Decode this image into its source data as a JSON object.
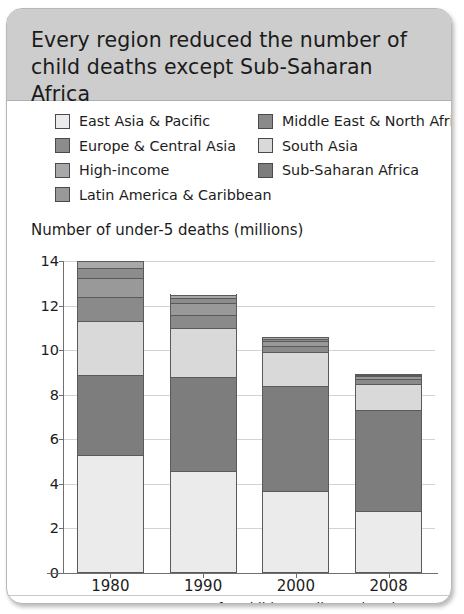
{
  "card": {
    "title": "Every region reduced the number of child deaths except Sub-Saharan Africa",
    "source": "Source: Inter-agency Group for Child Mortality estimation",
    "header_bg": "#cdcdcd"
  },
  "legend": {
    "left": [
      {
        "label": "East Asia & Pacific",
        "color": "#ebebeb"
      },
      {
        "label": "Europe & Central Asia",
        "color": "#8c8c8c"
      },
      {
        "label": "High-income",
        "color": "#a8a8a8"
      },
      {
        "label": "Latin America & Caribbean",
        "color": "#999999"
      }
    ],
    "right": [
      {
        "label": "Middle East & North Africa",
        "color": "#8a8a8a"
      },
      {
        "label": "South Asia",
        "color": "#d9d9d9"
      },
      {
        "label": "Sub-Saharan Africa",
        "color": "#7d7d7d"
      }
    ]
  },
  "chart_data": {
    "type": "bar",
    "subtype": "stacked",
    "title": "Every region reduced the number of child deaths except Sub-Saharan Africa",
    "xlabel": "",
    "ylabel": "Number of under-5 deaths (millions)",
    "ylim": [
      0,
      14
    ],
    "yticks": [
      0,
      2,
      4,
      6,
      8,
      10,
      12,
      14
    ],
    "grid": true,
    "legend_position": "top",
    "categories": [
      "1980",
      "1990",
      "2000",
      "2008"
    ],
    "series": [
      {
        "name": "East Asia & Pacific",
        "color": "#ebebeb",
        "values": [
          5.3,
          4.6,
          3.7,
          2.8
        ]
      },
      {
        "name": "Sub-Saharan Africa",
        "color": "#7d7d7d",
        "values": [
          3.6,
          4.2,
          4.7,
          4.5
        ]
      },
      {
        "name": "South Asia",
        "color": "#d9d9d9",
        "values": [
          2.4,
          2.2,
          1.5,
          1.2
        ]
      },
      {
        "name": "Middle East & North Africa",
        "color": "#8a8a8a",
        "values": [
          1.1,
          0.6,
          0.3,
          0.2
        ]
      },
      {
        "name": "Latin America & Caribbean",
        "color": "#999999",
        "values": [
          0.85,
          0.5,
          0.22,
          0.12
        ]
      },
      {
        "name": "Europe & Central Asia",
        "color": "#8c8c8c",
        "values": [
          0.45,
          0.25,
          0.1,
          0.06
        ]
      },
      {
        "name": "High-income",
        "color": "#a8a8a8",
        "values": [
          0.3,
          0.15,
          0.08,
          0.05
        ]
      }
    ],
    "totals": [
      14.0,
      12.5,
      10.6,
      8.93
    ]
  },
  "axis": {
    "y_title": "Number of under-5 deaths (millions)",
    "tick_labels": [
      "14",
      "12",
      "10",
      "8",
      "6",
      "4",
      "2",
      "0"
    ],
    "x_labels": [
      "1980",
      "1990",
      "2000",
      "2008"
    ]
  }
}
